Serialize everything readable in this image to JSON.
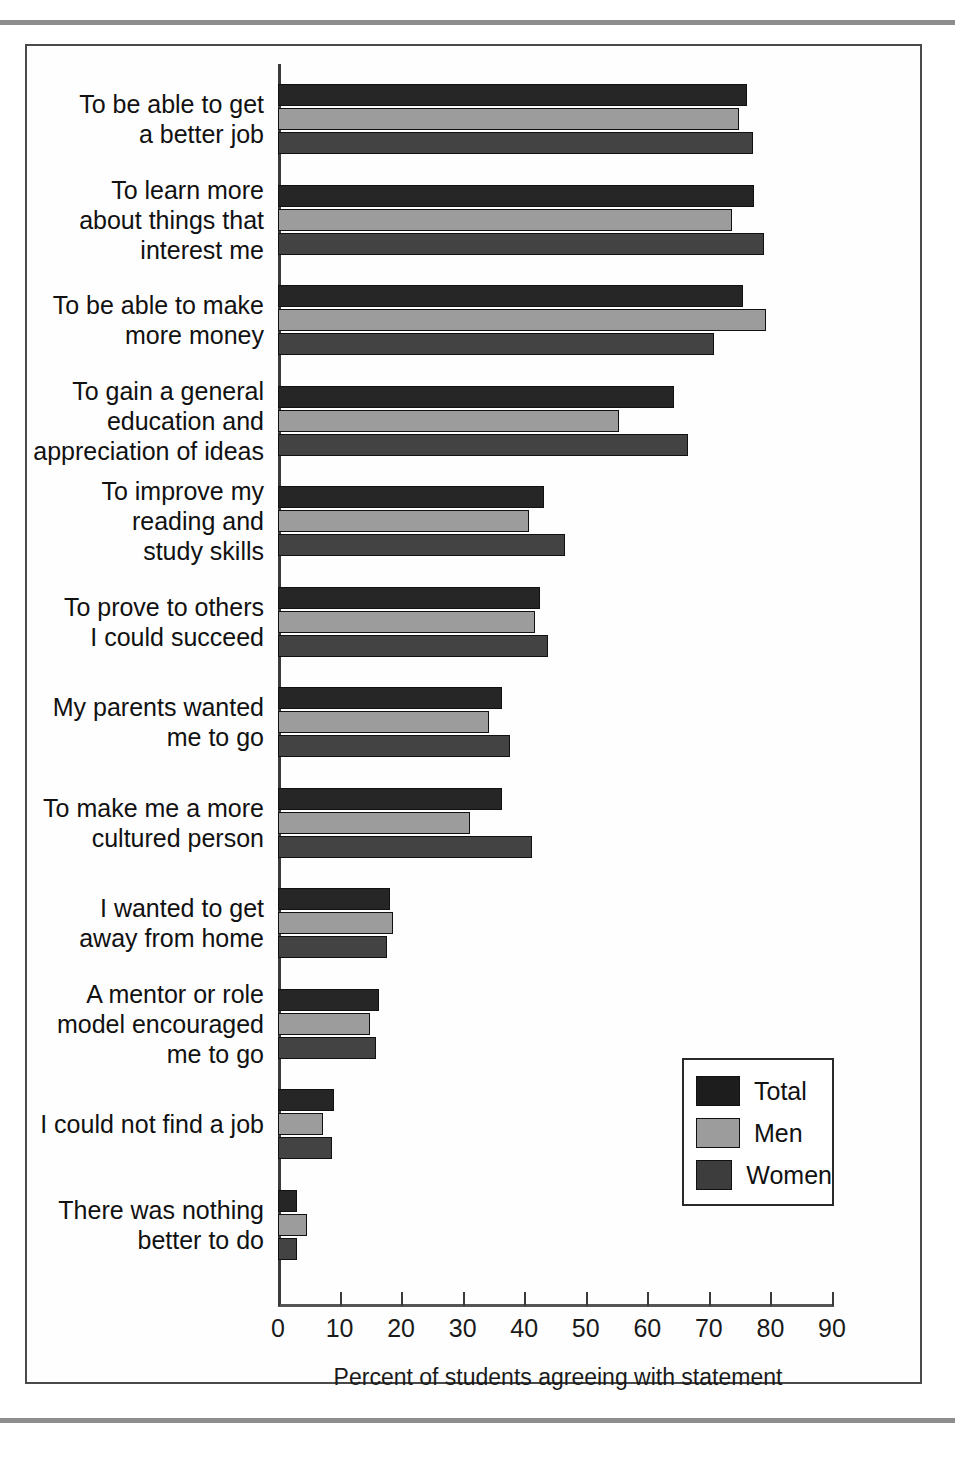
{
  "figure": {
    "frame_border_color": "#4a4a4a",
    "rule_color": "#8d8d8d"
  },
  "legend": {
    "position": "bottom-right",
    "entries": [
      {
        "label": "Total",
        "color": "#1d1d1d"
      },
      {
        "label": "Men",
        "color": "#9c9c9c"
      },
      {
        "label": "Women",
        "color": "#3d3d3d"
      }
    ]
  },
  "chart_data": {
    "type": "bar",
    "orientation": "horizontal",
    "title": "",
    "subtitle": "",
    "xlabel": "Percent of students agreeing with statement",
    "ylabel": "",
    "xlim": [
      0,
      90
    ],
    "xticks": [
      0,
      10,
      20,
      30,
      40,
      50,
      60,
      70,
      80,
      90
    ],
    "xticklabels": [
      "0",
      "10",
      "20",
      "30",
      "40",
      "50",
      "60",
      "70",
      "80",
      "90"
    ],
    "grid": false,
    "legend_position": "bottom-right",
    "categories": [
      "To be able to get\na better job",
      "To learn more\nabout things that\ninterest me",
      "To be able to make\nmore money",
      "To gain a general\neducation and\nappreciation of ideas",
      "To improve my\nreading and\nstudy skills",
      "To prove to others\nI could succeed",
      "My parents wanted\nme to go",
      "To make me a more\ncultured person",
      "I wanted to get\naway from home",
      "A mentor or role\nmodel encouraged\nme to go",
      "I could not find a job",
      "There was nothing\nbetter to do"
    ],
    "series": [
      {
        "name": "Total",
        "color": "#262626",
        "values": [
          76.2,
          77.4,
          75.5,
          64.4,
          43.2,
          42.5,
          36.4,
          36.4,
          18.2,
          16.4,
          9.1,
          3.1
        ]
      },
      {
        "name": "Men",
        "color": "#9c9c9c",
        "values": [
          74.9,
          73.7,
          79.2,
          55.4,
          40.7,
          41.7,
          34.3,
          31.2,
          18.7,
          15.0,
          7.3,
          4.7
        ]
      },
      {
        "name": "Women",
        "color": "#434343",
        "values": [
          77.2,
          79.0,
          70.8,
          66.6,
          46.6,
          43.8,
          37.7,
          41.2,
          17.7,
          16.0,
          8.8,
          3.1
        ]
      }
    ]
  }
}
